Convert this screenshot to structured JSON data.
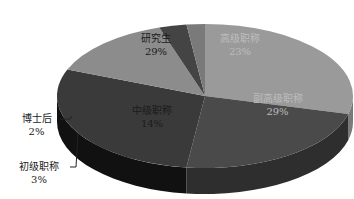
{
  "chart_data": {
    "type": "pie",
    "style": "3d",
    "title": "",
    "slices": [
      {
        "label": "研究生",
        "value": 29,
        "display": "29%",
        "color": "#9a9a9a",
        "side": "#7a7a7a"
      },
      {
        "label": "高级职称",
        "value": 23,
        "display": "23%",
        "color": "#4a4a4a",
        "side": "#2e2e2e"
      },
      {
        "label": "副高级职称",
        "value": 29,
        "display": "29%",
        "color": "#3a3a3a",
        "side": "#111111"
      },
      {
        "label": "中级职称",
        "value": 14,
        "display": "14%",
        "color": "#8c8c8c",
        "side": "#5a5a5a"
      },
      {
        "label": "初级职称",
        "value": 3,
        "display": "3%",
        "color": "#444444",
        "side": "#2a2a2a"
      },
      {
        "label": "博士后",
        "value": 2,
        "display": "2%",
        "color": "#7a7a7a",
        "side": "#555555"
      }
    ],
    "legend": "none",
    "data_labels": "category and percentage"
  },
  "labels": {
    "s0": {
      "name": "研究生",
      "pct": "29%"
    },
    "s1": {
      "name": "高级职称",
      "pct": "23%"
    },
    "s2": {
      "name": "副高级职称",
      "pct": "29%"
    },
    "s3": {
      "name": "中级职称",
      "pct": "14%"
    },
    "s4": {
      "name": "初级职称",
      "pct": "3%"
    },
    "s5": {
      "name": "博士后",
      "pct": "2%"
    }
  }
}
